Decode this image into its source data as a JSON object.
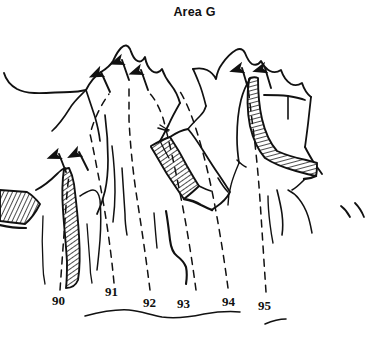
{
  "figure": {
    "title": "Area G",
    "kind": "hand-drawn line sketch",
    "background_color": "#ffffff",
    "ink_color": "#111111",
    "width": 389,
    "height": 338
  },
  "labels": [
    {
      "text": "90",
      "x": 52,
      "y": 293
    },
    {
      "text": "91",
      "x": 105,
      "y": 284
    },
    {
      "text": "92",
      "x": 143,
      "y": 295
    },
    {
      "text": "93",
      "x": 177,
      "y": 296
    },
    {
      "text": "94",
      "x": 222,
      "y": 294
    },
    {
      "text": "95",
      "x": 258,
      "y": 298
    }
  ],
  "annotations": {
    "arrow_count": 7,
    "hatched_band_count": 4,
    "baseline": "wavy ground line"
  }
}
